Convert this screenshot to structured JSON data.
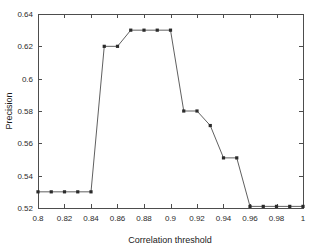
{
  "chart_data": {
    "type": "line",
    "title": "",
    "xlabel": "Correlation threshold",
    "ylabel": "Precision",
    "xlim": [
      0.8,
      1.0
    ],
    "ylim": [
      0.52,
      0.64
    ],
    "grid": false,
    "legend": null,
    "marker": "square",
    "line_color": "#606060",
    "marker_color": "#2b2b2b",
    "xticks": [
      0.8,
      0.82,
      0.84,
      0.86,
      0.88,
      0.9,
      0.92,
      0.94,
      0.96,
      0.98,
      1
    ],
    "xtick_labels": [
      "0.8",
      "0.82",
      "0.84",
      "0.86",
      "0.88",
      "0.9",
      "0.92",
      "0.94",
      "0.96",
      "0.98",
      "1"
    ],
    "yticks": [
      0.52,
      0.54,
      0.56,
      0.58,
      0.6,
      0.62,
      0.64
    ],
    "ytick_labels": [
      "0.52",
      "0.54",
      "0.56",
      "0.58",
      "0.6",
      "0.62",
      "0.64"
    ],
    "x": [
      0.8,
      0.81,
      0.82,
      0.83,
      0.84,
      0.85,
      0.86,
      0.87,
      0.88,
      0.89,
      0.9,
      0.91,
      0.92,
      0.93,
      0.94,
      0.95,
      0.96,
      0.97,
      0.98,
      0.99,
      1.0
    ],
    "values": [
      0.53,
      0.53,
      0.53,
      0.53,
      0.53,
      0.62,
      0.62,
      0.63,
      0.63,
      0.63,
      0.63,
      0.58,
      0.58,
      0.571,
      0.551,
      0.551,
      0.521,
      0.521,
      0.521,
      0.521,
      0.521
    ]
  }
}
